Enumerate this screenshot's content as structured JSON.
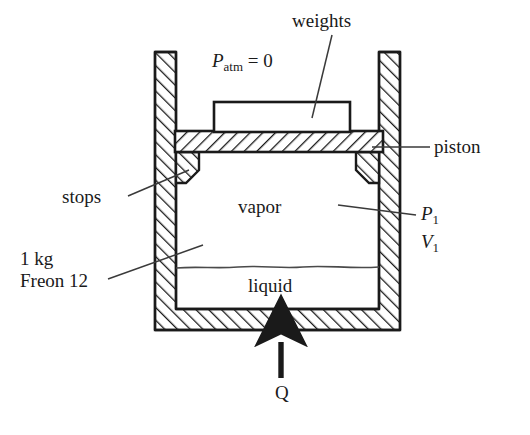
{
  "figure": {
    "colors": {
      "line": "#1a1a1a",
      "background": "#ffffff",
      "hatch": "#1a1a1a"
    }
  },
  "labels": {
    "weights": "weights",
    "p_atm_symbol": "P",
    "p_atm_subscript": "atm",
    "p_atm_value": "= 0",
    "piston": "piston",
    "stops": "stops",
    "vapor": "vapor",
    "liquid": "liquid",
    "pressure_symbol": "P",
    "pressure_subscript": "1",
    "volume_symbol": "V",
    "volume_subscript": "1",
    "mass": "1 kg",
    "substance": "Freon 12",
    "heat_symbol": "Q"
  },
  "geometry": {
    "cylinder_outer": {
      "x": 155,
      "y": 52,
      "width": 245,
      "height": 278
    },
    "wall_thickness": 21,
    "piston": {
      "x": 175,
      "y": 131,
      "width": 208,
      "height": 21
    },
    "weight_block": {
      "x": 214,
      "y": 102,
      "width": 136,
      "height": 30
    },
    "liquid_level_y": 267,
    "heat_arrow": {
      "x": 280,
      "y_bottom": 378,
      "y_top": 338
    }
  }
}
